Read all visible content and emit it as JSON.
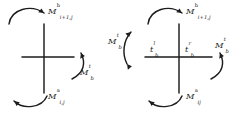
{
  "figure": {
    "name": "control-volume-mass-flux-diagram",
    "background_color": "#ffffff",
    "stroke_color": "#1c1c1c",
    "width": 243,
    "height": 116
  },
  "left_diagram": {
    "name": "t-junction-diagram",
    "shape": "vertical line with rightward horizontal stub",
    "labels": {
      "top": {
        "base": "M",
        "sub": "i+1,j",
        "sup": "b"
      },
      "right": {
        "base": "M",
        "sub": "b",
        "sup": "t"
      },
      "bottom": {
        "base": "M",
        "sub": "i,j",
        "sup": "a"
      }
    },
    "arrows": [
      {
        "name": "top-arc",
        "direction": "clockwise",
        "points_to": "right"
      },
      {
        "name": "right-arc",
        "direction": "clockwise",
        "points_to": "up"
      },
      {
        "name": "bottom-arc",
        "direction": "counterclockwise",
        "points_to": "left"
      }
    ]
  },
  "right_diagram": {
    "name": "cross-junction-diagram",
    "shape": "full cross (vertical and horizontal lines)",
    "labels": {
      "top": {
        "base": "M",
        "sub": "i+1,j",
        "sup": "b"
      },
      "left_outer": {
        "base": "M",
        "sub": "b",
        "sup": "t"
      },
      "right_outer": {
        "base": "M",
        "sub": "b",
        "sup": "t"
      },
      "center_left": {
        "base": "t",
        "sub": "b",
        "sup": "l"
      },
      "center_right": {
        "base": "t",
        "sub": "b",
        "sup": "r"
      },
      "bottom": {
        "base": "M",
        "sub": "ij",
        "sup": "a"
      }
    },
    "arrows": [
      {
        "name": "top-arc",
        "direction": "clockwise",
        "points_to": "right"
      },
      {
        "name": "left-arc",
        "direction": "counterclockwise",
        "points_to": "down-left"
      },
      {
        "name": "right-arc",
        "direction": "clockwise",
        "points_to": "up"
      },
      {
        "name": "bottom-arc",
        "direction": "counterclockwise",
        "points_to": "left"
      }
    ]
  }
}
